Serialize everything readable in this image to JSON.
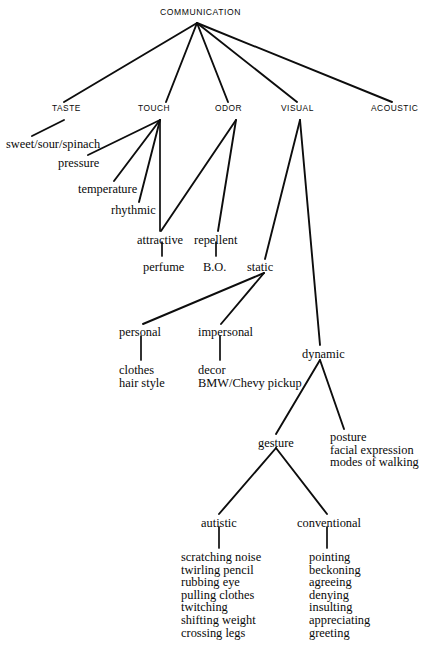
{
  "diagram": {
    "title": "COMMUNICATION",
    "type": "hierarchy-tree",
    "root": {
      "label": "COMMUNICATION",
      "x": 197,
      "y": 13
    },
    "senses": [
      {
        "id": "taste",
        "label": "TASTE",
        "x": 52,
        "y": 108
      },
      {
        "id": "touch",
        "label": "TOUCH",
        "x": 138,
        "y": 108
      },
      {
        "id": "odor",
        "label": "ODOR",
        "x": 215,
        "y": 108
      },
      {
        "id": "visual",
        "label": "VISUAL",
        "x": 281,
        "y": 108
      },
      {
        "id": "acoustic",
        "label": "ACOUSTIC",
        "x": 371,
        "y": 108
      }
    ],
    "nodes": [
      {
        "id": "sweet-sour-spinach",
        "label": "sweet/sour/spinach",
        "x": 6,
        "y": 139,
        "parent": "taste"
      },
      {
        "id": "pressure",
        "label": "pressure",
        "x": 58,
        "y": 158,
        "parent": "touch"
      },
      {
        "id": "temperature",
        "label": "temperature",
        "x": 78,
        "y": 184,
        "parent": "touch"
      },
      {
        "id": "rhythmic",
        "label": "rhythmic",
        "x": 111,
        "y": 205,
        "parent": "touch"
      },
      {
        "id": "attractive",
        "label": "attractive",
        "x": 137,
        "y": 235,
        "parent": "touch-odor"
      },
      {
        "id": "repellent",
        "label": "repellent",
        "x": 194,
        "y": 235,
        "parent": "odor"
      },
      {
        "id": "perfume",
        "label": "perfume",
        "x": 143,
        "y": 262,
        "parent": "attractive"
      },
      {
        "id": "bo",
        "label": "B.O.",
        "x": 203,
        "y": 262,
        "parent": "repellent"
      },
      {
        "id": "static",
        "label": "static",
        "x": 247,
        "y": 262,
        "parent": "visual"
      },
      {
        "id": "personal",
        "label": "personal",
        "x": 119,
        "y": 327,
        "parent": "static"
      },
      {
        "id": "impersonal",
        "label": "impersonal",
        "x": 198,
        "y": 327,
        "parent": "static"
      },
      {
        "id": "dynamic",
        "label": "dynamic",
        "x": 302,
        "y": 349,
        "parent": "visual"
      },
      {
        "id": "gesture",
        "label": "gesture",
        "x": 258,
        "y": 438,
        "parent": "dynamic"
      },
      {
        "id": "autistic",
        "label": "autistic",
        "x": 201,
        "y": 518,
        "parent": "gesture"
      },
      {
        "id": "conventional",
        "label": "conventional",
        "x": 297,
        "y": 518,
        "parent": "gesture"
      }
    ],
    "leaf_lists": [
      {
        "id": "personal-leaves",
        "parent": "personal",
        "x": 119,
        "y": 365,
        "items": [
          "clothes",
          "hair style"
        ]
      },
      {
        "id": "impersonal-leaves",
        "parent": "impersonal",
        "x": 198,
        "y": 365,
        "items": [
          "decor",
          "BMW/Chevy pickup"
        ]
      },
      {
        "id": "posture-leaves",
        "parent": "dynamic",
        "x": 330,
        "y": 432,
        "items": [
          "posture",
          "facial expression",
          "modes of walking"
        ]
      },
      {
        "id": "autistic-leaves",
        "parent": "autistic",
        "x": 181,
        "y": 552,
        "items": [
          "scratching noise",
          "twirling pencil",
          "rubbing eye",
          "pulling clothes",
          "twitching",
          "shifting weight",
          "crossing legs"
        ]
      },
      {
        "id": "conventional-leaves",
        "parent": "conventional",
        "x": 309,
        "y": 552,
        "items": [
          "pointing",
          "beckoning",
          "agreeing",
          "denying",
          "insulting",
          "appreciating",
          "greeting"
        ]
      }
    ],
    "edges": [
      {
        "from": "root",
        "to": "taste",
        "x1": 197,
        "y1": 23,
        "x2": 64,
        "y2": 102
      },
      {
        "from": "root",
        "to": "touch",
        "x1": 197,
        "y1": 23,
        "x2": 166,
        "y2": 102
      },
      {
        "from": "root",
        "to": "odor",
        "x1": 197,
        "y1": 23,
        "x2": 228,
        "y2": 102
      },
      {
        "from": "root",
        "to": "visual",
        "x1": 197,
        "y1": 23,
        "x2": 297,
        "y2": 102
      },
      {
        "from": "root",
        "to": "acoustic",
        "x1": 197,
        "y1": 23,
        "x2": 392,
        "y2": 102
      },
      {
        "from": "taste",
        "to": "sweet-sour-spinach",
        "x1": 64,
        "y1": 120,
        "x2": 32,
        "y2": 136
      },
      {
        "from": "touch",
        "to": "pressure",
        "x1": 160,
        "y1": 120,
        "x2": 88,
        "y2": 155
      },
      {
        "from": "touch",
        "to": "temperature",
        "x1": 160,
        "y1": 120,
        "x2": 114,
        "y2": 181
      },
      {
        "from": "touch",
        "to": "rhythmic",
        "x1": 160,
        "y1": 120,
        "x2": 139,
        "y2": 202
      },
      {
        "from": "touch",
        "to": "attractive",
        "x1": 160,
        "y1": 120,
        "x2": 160,
        "y2": 231
      },
      {
        "from": "odor",
        "to": "attractive",
        "x1": 236,
        "y1": 120,
        "x2": 161,
        "y2": 231
      },
      {
        "from": "odor",
        "to": "repellent",
        "x1": 236,
        "y1": 120,
        "x2": 218,
        "y2": 231
      },
      {
        "from": "attractive",
        "to": "perfume",
        "x1": 162,
        "y1": 242,
        "x2": 162,
        "y2": 256
      },
      {
        "from": "repellent",
        "to": "bo",
        "x1": 216,
        "y1": 242,
        "x2": 216,
        "y2": 256
      },
      {
        "from": "visual",
        "to": "static",
        "x1": 300,
        "y1": 120,
        "x2": 265,
        "y2": 259
      },
      {
        "from": "visual",
        "to": "dynamic",
        "x1": 300,
        "y1": 120,
        "x2": 320,
        "y2": 345
      },
      {
        "from": "static",
        "to": "personal",
        "x1": 264,
        "y1": 273,
        "x2": 143,
        "y2": 324
      },
      {
        "from": "static",
        "to": "impersonal",
        "x1": 264,
        "y1": 273,
        "x2": 221,
        "y2": 324
      },
      {
        "from": "personal",
        "to": "personal-leaves",
        "x1": 141,
        "y1": 336,
        "x2": 141,
        "y2": 360
      },
      {
        "from": "impersonal",
        "to": "impersonal-leaves",
        "x1": 220,
        "y1": 336,
        "x2": 220,
        "y2": 360
      },
      {
        "from": "dynamic",
        "to": "gesture",
        "x1": 320,
        "y1": 360,
        "x2": 276,
        "y2": 434
      },
      {
        "from": "dynamic",
        "to": "posture-leaves",
        "x1": 320,
        "y1": 360,
        "x2": 344,
        "y2": 429
      },
      {
        "from": "gesture",
        "to": "autistic",
        "x1": 276,
        "y1": 448,
        "x2": 219,
        "y2": 514
      },
      {
        "from": "gesture",
        "to": "conventional",
        "x1": 276,
        "y1": 448,
        "x2": 327,
        "y2": 514
      },
      {
        "from": "autistic",
        "to": "autistic-leaves",
        "x1": 219,
        "y1": 527,
        "x2": 219,
        "y2": 548
      },
      {
        "from": "conventional",
        "to": "conventional-leaves",
        "x1": 327,
        "y1": 527,
        "x2": 327,
        "y2": 548
      }
    ],
    "colors": {
      "ink": "#0d0d0d",
      "background": "#ffffff"
    }
  }
}
